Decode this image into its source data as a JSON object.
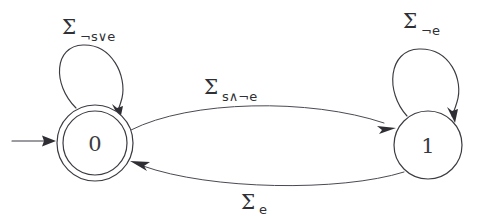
{
  "figure": {
    "kind": "finite-state-automaton-diagram",
    "background_color": "#ffffff",
    "ink_color": "#3b3b42"
  },
  "states": [
    {
      "id": "0",
      "label": "0",
      "accepting": true,
      "initial": true,
      "cx": 95,
      "cy": 143,
      "r_outer": 38,
      "r_inner": 32
    },
    {
      "id": "1",
      "label": "1",
      "accepting": false,
      "initial": false,
      "cx": 428,
      "cy": 145,
      "r_outer": 34,
      "r_inner": 0
    }
  ],
  "transitions": [
    {
      "name": "self-loop-state-0",
      "from": "0",
      "to": "0",
      "sigma": "Σ",
      "subscript": "¬s∨e",
      "label_x": 62,
      "label_y": 34
    },
    {
      "name": "self-loop-state-1",
      "from": "1",
      "to": "1",
      "sigma": "Σ",
      "subscript": "¬e",
      "label_x": 403,
      "label_y": 28
    },
    {
      "name": "transition-0-to-1",
      "from": "0",
      "to": "1",
      "sigma": "Σ",
      "subscript": "s∧¬e",
      "label_x": 204,
      "label_y": 94
    },
    {
      "name": "transition-1-to-0",
      "from": "1",
      "to": "0",
      "sigma": "Σ",
      "subscript": "e",
      "label_x": 241,
      "label_y": 209
    }
  ],
  "initial_arrow": {
    "name": "initial-state-arrow",
    "x_start": 12,
    "x_end": 55,
    "y": 141
  }
}
